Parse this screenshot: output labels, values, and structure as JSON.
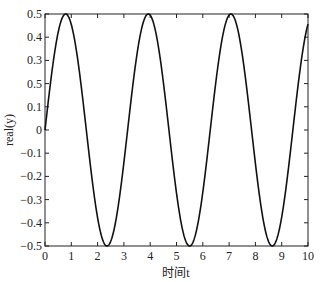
{
  "chart_data": {
    "type": "line",
    "title": "",
    "xlabel": "时间t",
    "ylabel": "real(y)",
    "xlim": [
      0,
      10
    ],
    "ylim": [
      -0.5,
      0.5
    ],
    "grid": false,
    "legend": null,
    "x_ticks": [
      "0",
      "1",
      "2",
      "3",
      "4",
      "5",
      "6",
      "7",
      "8",
      "9",
      "10"
    ],
    "y_ticks": [
      "0.5",
      "0.4",
      "0.3",
      "0.5",
      "0.1",
      "0",
      "-0.1",
      "-0.2",
      "-0.3",
      "-0.4",
      "-0.5"
    ],
    "series": [
      {
        "name": "real(y)",
        "formula": "0.5*sin(2t)",
        "x": [
          0,
          0.785,
          2.356,
          3.927,
          5.498,
          7.069,
          8.639,
          10
        ],
        "values": [
          0,
          0.5,
          -0.5,
          0.5,
          -0.5,
          0.5,
          -0.5,
          0.456
        ],
        "color": "#111111"
      }
    ]
  }
}
